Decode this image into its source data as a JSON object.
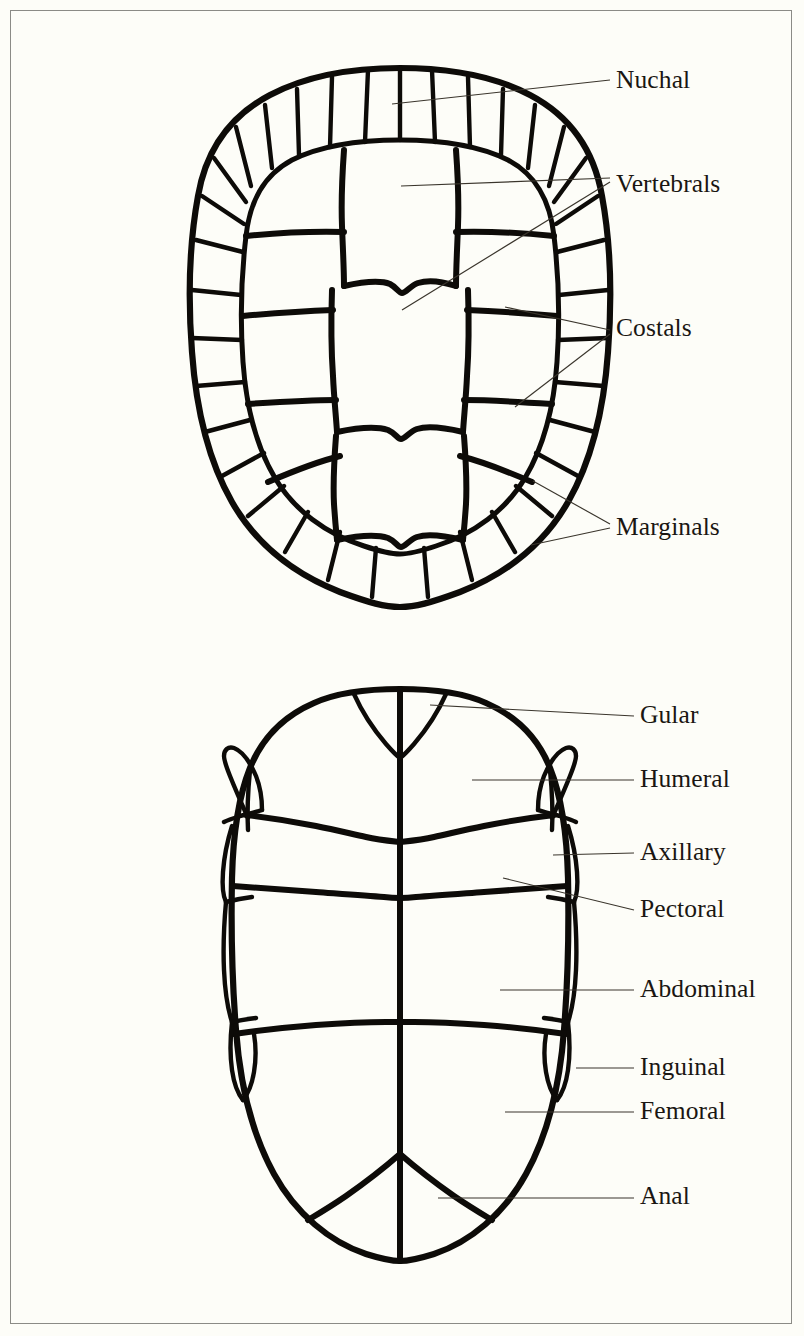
{
  "figure": {
    "background_color": "#fdfdf8",
    "ink_color": "#0d0b08",
    "border_color": "#8b8b86",
    "leader_color": "#3a352c"
  },
  "panels": [
    {
      "id": "carapace",
      "name": "carapace-dorsal-view",
      "labels": [
        "Nuchal",
        "Vertebrals",
        "Costals",
        "Marginals"
      ]
    },
    {
      "id": "plastron",
      "name": "plastron-ventral-view",
      "labels": [
        "Gular",
        "Humeral",
        "Axillary",
        "Pectoral",
        "Abdominal",
        "Inguinal",
        "Femoral",
        "Anal"
      ]
    }
  ],
  "labels": [
    {
      "id": "nuchal",
      "text": "Nuchal",
      "x": 616,
      "y": 88,
      "panel": "carapace"
    },
    {
      "id": "vertebrals",
      "text": "Vertebrals",
      "x": 616,
      "y": 192,
      "panel": "carapace"
    },
    {
      "id": "costals",
      "text": "Costals",
      "x": 616,
      "y": 336,
      "panel": "carapace"
    },
    {
      "id": "marginals",
      "text": "Marginals",
      "x": 616,
      "y": 535,
      "panel": "carapace"
    },
    {
      "id": "gular",
      "text": "Gular",
      "x": 640,
      "y": 723,
      "panel": "plastron"
    },
    {
      "id": "humeral",
      "text": "Humeral",
      "x": 640,
      "y": 787,
      "panel": "plastron"
    },
    {
      "id": "axillary",
      "text": "Axillary",
      "x": 640,
      "y": 860,
      "panel": "plastron"
    },
    {
      "id": "pectoral",
      "text": "Pectoral",
      "x": 640,
      "y": 917,
      "panel": "plastron"
    },
    {
      "id": "abdominal",
      "text": "Abdominal",
      "x": 640,
      "y": 997,
      "panel": "plastron"
    },
    {
      "id": "inguinal",
      "text": "Inguinal",
      "x": 640,
      "y": 1075,
      "panel": "plastron"
    },
    {
      "id": "femoral",
      "text": "Femoral",
      "x": 640,
      "y": 1119,
      "panel": "plastron"
    },
    {
      "id": "anal",
      "text": "Anal",
      "x": 640,
      "y": 1204,
      "panel": "plastron"
    }
  ],
  "leaders": [
    {
      "id": "leader-nuchal",
      "label": "Nuchal",
      "d": "M 392 104 L 610 80"
    },
    {
      "id": "leader-vertebrals-1",
      "label": "Vertebrals",
      "d": "M 401 186 L 610 178"
    },
    {
      "id": "leader-vertebrals-2",
      "label": "Vertebrals",
      "d": "M 402 310 L 610 182"
    },
    {
      "id": "leader-costals-1",
      "label": "Costals",
      "d": "M 505 307 L 610 330"
    },
    {
      "id": "leader-costals-2",
      "label": "Costals",
      "d": "M 515 407 L 610 334"
    },
    {
      "id": "leader-marginals-1",
      "label": "Marginals",
      "d": "M 533 481 L 610 524"
    },
    {
      "id": "leader-marginals-2",
      "label": "Marginals",
      "d": "M 531 545 L 610 528"
    },
    {
      "id": "leader-gular",
      "label": "Gular",
      "d": "M 430 705 L 634 716"
    },
    {
      "id": "leader-humeral",
      "label": "Humeral",
      "d": "M 472 780 L 634 780"
    },
    {
      "id": "leader-axillary",
      "label": "Axillary",
      "d": "M 553 855 L 634 853"
    },
    {
      "id": "leader-pectoral",
      "label": "Pectoral",
      "d": "M 503 878 L 634 910"
    },
    {
      "id": "leader-abdominal",
      "label": "Abdominal",
      "d": "M 500 990 L 634 990"
    },
    {
      "id": "leader-inguinal",
      "label": "Inguinal",
      "d": "M 576 1068 L 634 1068"
    },
    {
      "id": "leader-femoral",
      "label": "Femoral",
      "d": "M 505 1112 L 634 1112"
    },
    {
      "id": "leader-anal",
      "label": "Anal",
      "d": "M 438 1198 L 634 1198"
    }
  ],
  "carapace_paths": {
    "outer_outline": "M 400 68 C 352 68 306 76 270 95 C 230 116 206 150 198 196 C 189 245 188 300 192 352 C 196 408 208 460 232 502 C 256 544 294 574 340 592 C 370 603 385 607 400 607 C 415 607 430 603 460 592 C 506 574 544 544 568 502 C 592 460 604 408 608 352 C 612 300 611 245 602 196 C 594 150 570 116 530 95 C 494 76 448 68 400 68 Z",
    "inner_ring": "M 400 140 C 358 140 320 146 292 160 C 264 175 250 200 246 236 C 241 278 240 320 243 362 C 246 406 256 446 275 478 C 294 510 326 534 364 546 C 382 552 392 554 400 554 C 408 554 418 552 436 546 C 474 534 506 510 525 478 C 544 446 554 406 557 362 C 560 320 559 278 554 236 C 550 200 536 175 508 160 C 480 146 442 140 400 140 Z",
    "marginal_radials": [
      "M 400 68 L 400 140",
      "M 368 70 L 365 142",
      "M 332 77 L 330 147",
      "M 297 89 L 299 155",
      "M 265 105 L 272 168",
      "M 236 127 L 251 186",
      "M 214 158 L 246 202",
      "M 202 196 L 244 224",
      "M 196 240 L 243 252",
      "M 192 290 L 241 295",
      "M 192 338 L 242 340",
      "M 196 386 L 245 382",
      "M 205 432 L 250 420",
      "M 222 476 L 264 453",
      "M 248 516 L 284 486",
      "M 285 552 L 308 512",
      "M 328 580 L 340 532",
      "M 372 597 L 376 548",
      "M 428 597 L 424 548",
      "M 472 580 L 460 532",
      "M 515 552 L 492 512",
      "M 552 516 L 516 486",
      "M 578 476 L 536 453",
      "M 595 432 L 550 420",
      "M 604 386 L 555 382",
      "M 608 338 L 558 340",
      "M 608 290 L 559 295",
      "M 604 240 L 557 252",
      "M 598 196 L 556 224",
      "M 586 158 L 554 202",
      "M 564 127 L 549 186",
      "M 535 105 L 528 168",
      "M 503 89 L 501 155",
      "M 468 77 L 470 147",
      "M 432 70 L 435 142"
    ],
    "vertebral_seams": [
      "M 344 150 C 342 178 341 200 342 226 C 343 252 344 270 344 286",
      "M 456 150 C 458 178 459 200 458 226 C 457 252 456 270 456 286",
      "M 344 286 C 362 282 380 280 390 284 C 396 287 399 293 402 293 C 406 293 410 286 418 283 C 430 279 444 282 456 286",
      "M 332 290 C 331 320 331 348 333 376 C 334 398 336 416 337 432",
      "M 468 290 C 469 320 469 348 467 376 C 466 398 464 416 463 432",
      "M 337 432 C 356 428 376 426 388 430 C 395 433 398 439 401 439 C 405 439 409 432 417 429 C 429 425 446 428 463 432",
      "M 336 436 C 334 462 333 484 334 504 C 335 520 336 530 337 540",
      "M 464 436 C 466 462 467 484 466 504 C 465 520 464 530 463 540",
      "M 337 540 C 356 536 376 534 388 538 C 395 541 398 547 401 547 C 405 547 409 540 417 537 C 429 533 446 536 463 540"
    ],
    "costal_seams": [
      "M 246 236 C 276 233 308 231 344 232",
      "M 554 236 C 524 233 492 231 456 232",
      "M 243 316 C 276 313 306 311 333 310",
      "M 557 316 C 524 313 494 311 467 310",
      "M 248 404 C 278 402 308 400 336 400",
      "M 552 404 C 522 402 492 400 464 400",
      "M 268 482 C 296 470 316 462 340 456",
      "M 532 482 C 504 470 484 462 460 456"
    ]
  },
  "plastron_paths": {
    "outer_outline": "M 400 689 C 368 689 336 693 314 703 C 284 716 262 738 250 768 C 238 798 233 836 232 878 C 231 926 232 980 236 1030 C 240 1084 252 1134 274 1174 C 296 1214 330 1242 366 1254 C 382 1259 392 1261 400 1261 C 408 1261 418 1259 434 1254 C 470 1242 504 1214 526 1174 C 548 1134 560 1084 564 1030 C 568 980 569 926 568 878 C 567 836 562 798 550 768 C 538 738 516 716 486 703 C 464 693 432 689 400 689 Z",
    "midline": "M 400 689 L 400 1261",
    "gular_seams": [
      "M 354 694 C 362 712 374 730 386 744 C 393 752 397 756 400 758",
      "M 446 694 C 438 712 426 730 414 744 C 407 752 403 756 400 758"
    ],
    "humeral_pectoral_seam": "M 246 815 C 272 818 296 822 316 826 C 336 830 352 834 366 837 C 378 840 390 841 400 842 C 410 841 422 840 434 837 C 448 834 464 830 484 826 C 504 822 528 818 554 815",
    "pectoral_abdominal_seam": "M 233 886 C 262 888 290 890 316 892 C 342 894 366 896 384 897 C 392 898 396 898 400 898 C 404 898 408 898 416 897 C 434 896 458 894 484 892 C 510 890 538 888 567 886",
    "abdominal_femoral_seam": "M 234 1034 C 262 1030 290 1027 316 1025 C 344 1023 368 1022 386 1022 C 393 1022 397 1022 400 1022 C 403 1022 407 1022 414 1022 C 432 1022 456 1023 484 1025 C 510 1027 538 1030 566 1034",
    "femoral_anal_seams": [
      "M 400 1154 C 384 1168 366 1182 346 1196 C 330 1207 318 1214 308 1220",
      "M 400 1154 C 416 1168 434 1182 454 1196 C 470 1207 482 1214 492 1220"
    ],
    "bridge_left": [
      "M 248 818 C 240 800 234 786 230 776 C 226 766 224 760 224 756 C 224 750 228 746 234 748 C 242 751 250 762 256 776 C 260 786 262 798 262 810",
      "M 232 826 C 227 842 224 858 223 872 C 222 886 223 896 226 902",
      "M 226 902 C 224 924 223 948 224 970 C 225 992 228 1010 232 1022",
      "M 232 1022 C 230 1040 230 1056 232 1070 C 234 1084 238 1094 243 1100",
      "M 262 810 C 256 812 248 814 240 816 C 234 818 228 820 224 822",
      "M 226 902 C 234 900 244 898 252 897",
      "M 232 1022 C 240 1020 248 1019 256 1018",
      "M 243 1100 C 248 1094 252 1084 254 1072 C 256 1060 256 1046 254 1034"
    ],
    "bridge_right": [
      "M 552 818 C 560 800 566 786 570 776 C 574 766 576 760 576 756 C 576 750 572 746 566 748 C 558 751 550 762 544 776 C 540 786 538 798 538 810",
      "M 568 826 C 573 842 576 858 577 872 C 578 886 577 896 574 902",
      "M 574 902 C 576 924 577 948 576 970 C 575 992 572 1010 568 1022",
      "M 568 1022 C 570 1040 570 1056 568 1070 C 566 1084 562 1094 557 1100",
      "M 538 810 C 544 812 552 814 560 816 C 566 818 572 820 576 822",
      "M 574 902 C 566 900 556 898 548 897",
      "M 568 1022 C 560 1020 552 1019 544 1018",
      "M 557 1100 C 552 1094 548 1084 546 1072 C 544 1060 544 1046 546 1034"
    ],
    "bridge_inner_left": "M 250 770 C 248 790 247 812 248 830",
    "bridge_inner_right": "M 550 770 C 552 790 553 812 552 830"
  }
}
